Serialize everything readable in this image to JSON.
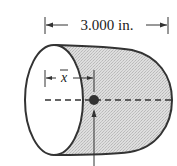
{
  "figure": {
    "type": "centroid-diagram",
    "shape": "half-cylinder-like solid with hemispherical-style rounded end",
    "length_label": "3.000 in.",
    "centroid_label": "x̄",
    "centroid_label_base": "x",
    "colors": {
      "outline": "#333333",
      "fill_shaded": "#d6d6d6",
      "open_face": "#ffffff",
      "centroid_dot": "#333333"
    }
  }
}
